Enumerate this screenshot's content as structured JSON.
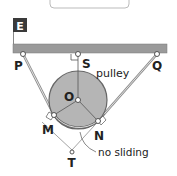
{
  "diagram": {
    "type": "physics-pulley-system",
    "colors": {
      "ceiling": "#9a9a9a",
      "ceiling_edge": "#6e6e6e",
      "pulley_fill": "#b5b5b5",
      "pulley_stroke": "#666666",
      "rope": "#9c9c9c",
      "label_box": "#3a3a3a",
      "text": "#222222"
    },
    "tag_box": {
      "label": "E"
    },
    "points": {
      "P": {
        "label": "P",
        "x": 23,
        "y": 54
      },
      "S": {
        "label": "S",
        "x": 78,
        "y": 54
      },
      "Q": {
        "label": "Q",
        "x": 157,
        "y": 54
      },
      "O": {
        "label": "O",
        "x": 78,
        "y": 100
      },
      "M": {
        "label": "M",
        "x": 54,
        "y": 115
      },
      "N": {
        "label": "N",
        "x": 98,
        "y": 121
      },
      "T": {
        "label": "T",
        "x": 72,
        "y": 150
      }
    },
    "annotations": {
      "pulley": "pulley",
      "no_sliding": "no sliding"
    }
  }
}
